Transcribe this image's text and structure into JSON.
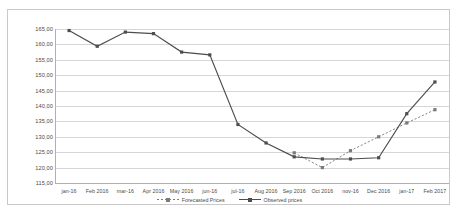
{
  "chart_data": {
    "type": "line",
    "title": "",
    "xlabel": "",
    "ylabel": "",
    "ylim": [
      115,
      165
    ],
    "ytick_step": 5,
    "grid": true,
    "legend_position": "bottom",
    "ytick_labels": [
      "165,00",
      "160,00",
      "155,00",
      "150,00",
      "145,00",
      "140,00",
      "135,00",
      "130,00",
      "125,00",
      "120,00",
      "115,00"
    ],
    "categories": [
      "jan-16",
      "Feb 2016",
      "mar-16",
      "Apr 2016",
      "May 2016",
      "jun-16",
      "jul-16",
      "Aug 2016",
      "Sep 2016",
      "Oct 2016",
      "nov-16",
      "Dec 2016",
      "jan-17",
      "Feb 2017"
    ],
    "series": [
      {
        "name": "Forecasted Prices",
        "style": "dashed",
        "color": "#7a7a7a",
        "values": [
          null,
          null,
          null,
          null,
          null,
          null,
          null,
          null,
          124.8,
          120.0,
          125.5,
          130.0,
          134.5,
          138.8
        ]
      },
      {
        "name": "Observed prices",
        "style": "solid",
        "color": "#4d4d4d",
        "values": [
          164.5,
          159.4,
          164.0,
          163.5,
          157.5,
          156.6,
          134.0,
          128.0,
          123.5,
          122.8,
          122.8,
          123.2,
          137.5,
          147.8
        ]
      }
    ]
  },
  "legend": {
    "items": [
      {
        "label": "Forecasted Prices"
      },
      {
        "label": "Observed prices"
      }
    ]
  }
}
